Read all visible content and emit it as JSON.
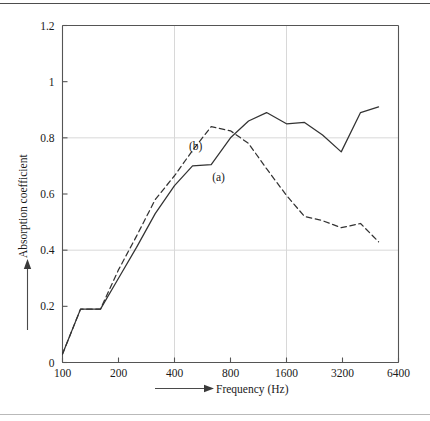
{
  "chart_data": {
    "type": "line",
    "title": "",
    "subtitle": "",
    "xlabel": "Frequency (Hz)",
    "ylabel": "Absorption coefficient",
    "xscale": "log",
    "yscale": "linear",
    "xlim": [
      100,
      6400
    ],
    "ylim": [
      0,
      1.2
    ],
    "xticks": [
      100,
      200,
      400,
      800,
      1600,
      3200,
      6400
    ],
    "xticklabels": [
      "100",
      "200",
      "400",
      "800",
      "1600",
      "3200",
      "6400"
    ],
    "yticks": [
      0,
      0.2,
      0.4,
      0.6,
      0.8,
      1,
      1.2
    ],
    "yticklabels": [
      "0",
      "0.2",
      "0.4",
      "0.6",
      "0.8",
      "1",
      "1.2"
    ],
    "grid": {
      "horizontal_at": [
        0.4,
        0.8
      ],
      "vertical_at": [
        400,
        1600
      ],
      "color": "#d8d8d8"
    },
    "legend": {
      "position": "inline-annotation",
      "entries": [
        {
          "label": "(a)",
          "style": "solid"
        },
        {
          "label": "(b)",
          "style": "dashed"
        }
      ]
    },
    "annotations": [
      {
        "text": "(b)",
        "x": 520,
        "y": 0.755
      },
      {
        "text": "(a)",
        "x": 690,
        "y": 0.645
      }
    ],
    "series": [
      {
        "name": "(a)",
        "style": "solid",
        "x": [
          100,
          125,
          160,
          200,
          250,
          315,
          400,
          500,
          630,
          800,
          1000,
          1250,
          1600,
          2000,
          2500,
          3150,
          4000,
          5000
        ],
        "values": [
          0.03,
          0.19,
          0.19,
          0.3,
          0.41,
          0.53,
          0.63,
          0.7,
          0.705,
          0.8,
          0.86,
          0.89,
          0.85,
          0.855,
          0.81,
          0.75,
          0.89,
          0.91
        ]
      },
      {
        "name": "(b)",
        "style": "dashed",
        "x": [
          100,
          125,
          160,
          200,
          250,
          315,
          400,
          500,
          630,
          800,
          1000,
          1250,
          1600,
          2000,
          2500,
          3150,
          4000,
          5000
        ],
        "values": [
          0.03,
          0.19,
          0.19,
          0.33,
          0.45,
          0.58,
          0.665,
          0.755,
          0.84,
          0.825,
          0.78,
          0.69,
          0.595,
          0.52,
          0.505,
          0.48,
          0.495,
          0.43
        ]
      }
    ]
  },
  "axes": {
    "y_axis_arrow_label": "Absorption coefficient",
    "x_axis_arrow_label": "Frequency (Hz)"
  }
}
